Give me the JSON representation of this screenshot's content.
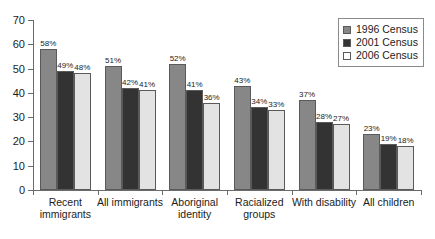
{
  "chart_data": {
    "type": "bar",
    "title": "",
    "subtitle": "",
    "xlabel": "",
    "ylabel": "",
    "ylim": [
      0,
      70
    ],
    "yticks": [
      0,
      10,
      20,
      30,
      40,
      50,
      60,
      70
    ],
    "grid": false,
    "legend_position": "top-right",
    "value_suffix": "%",
    "categories": [
      "Recent immigrants",
      "All immigrants",
      "Aboriginal identity",
      "Racialized groups",
      "With disability",
      "All children"
    ],
    "category_lines": [
      [
        "Recent",
        "immigrants"
      ],
      [
        "All immigrants"
      ],
      [
        "Aboriginal",
        "identity"
      ],
      [
        "Racialized",
        "groups"
      ],
      [
        "With disability"
      ],
      [
        "All children"
      ]
    ],
    "series": [
      {
        "name": "1996 Census",
        "color": "#878787",
        "values": [
          58,
          51,
          52,
          43,
          37,
          23
        ],
        "labels": [
          "58%",
          "51%",
          "52%",
          "43%",
          "37%",
          "23%"
        ]
      },
      {
        "name": "2001 Census",
        "color": "#333333",
        "values": [
          49,
          42,
          41,
          34,
          28,
          19
        ],
        "labels": [
          "49%",
          "42%",
          "41%",
          "34%",
          "28%",
          "19%"
        ]
      },
      {
        "name": "2006 Census",
        "color": "#e3e3e3",
        "values": [
          48,
          41,
          36,
          33,
          27,
          18
        ],
        "labels": [
          "48%",
          "41%",
          "36%",
          "33%",
          "27%",
          "18%"
        ]
      }
    ]
  },
  "legend": {
    "items": [
      {
        "label": "1996 Census"
      },
      {
        "label": "2001 Census"
      },
      {
        "label": "2006 Census"
      }
    ]
  },
  "axis": {
    "y_tick_labels": [
      "0",
      "10",
      "20",
      "30",
      "40",
      "50",
      "60",
      "70"
    ]
  }
}
